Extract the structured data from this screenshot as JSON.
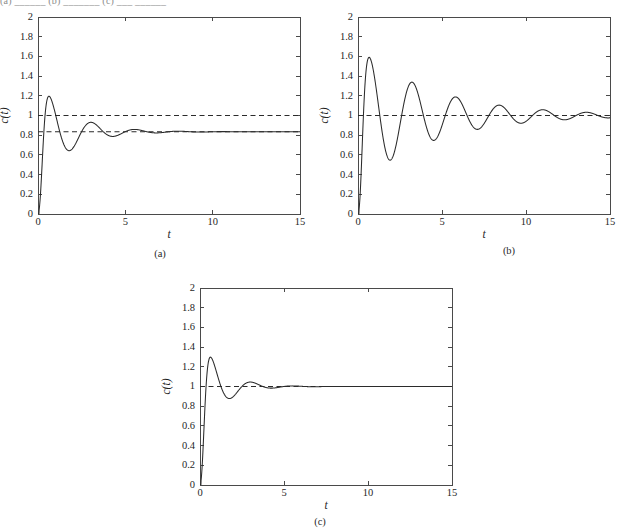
{
  "page": {
    "header_fragment": "(a)    ______  (b) _______ (c)  ___  ______",
    "background": "#ffffff",
    "ink": "#2b2b2b"
  },
  "captions": {
    "a": "(a)",
    "b": "(b)",
    "c": "(c)"
  },
  "chart_data": [
    {
      "id": "a",
      "type": "line",
      "title": "",
      "xlabel": "t",
      "ylabel": "c(t)",
      "xlim": [
        0,
        15
      ],
      "ylim": [
        0,
        2
      ],
      "xticks": [
        0,
        5,
        10,
        15
      ],
      "xticklabels": [
        "0",
        "5",
        "10",
        "15"
      ],
      "yticks": [
        0,
        0.2,
        0.4,
        0.6,
        0.8,
        1,
        1.2,
        1.4,
        1.6,
        1.8,
        2
      ],
      "yticklabels": [
        "0",
        "0.2",
        "0.4",
        "0.6",
        "0.8",
        "1",
        "1.2",
        "1.4",
        "1.6",
        "1.8",
        "2"
      ],
      "grid": false,
      "legend": null,
      "reference_lines": [
        {
          "name": "unity-reference",
          "y": 1.0,
          "style": "dashed"
        },
        {
          "name": "steady-state-reference",
          "y": 0.835,
          "style": "dashed"
        }
      ],
      "series": [
        {
          "name": "step-response-a",
          "style": "solid",
          "model": "damped-step",
          "steady_state": 0.835,
          "amplitude": 0.535,
          "damping_rate": 0.56,
          "angular_freq": 2.52,
          "phase": 1.5708,
          "rise_shape": 1.0,
          "peaks": [
            {
              "t": 1.45,
              "c": 1.285
            },
            {
              "t": 3.9,
              "c": 1.0
            },
            {
              "t": 6.35,
              "c": 0.885
            },
            {
              "t": 8.8,
              "c": 0.85
            }
          ],
          "troughs": [
            {
              "t": 2.65,
              "c": 0.545
            },
            {
              "t": 5.1,
              "c": 0.715
            },
            {
              "t": 7.55,
              "c": 0.795
            }
          ]
        }
      ]
    },
    {
      "id": "b",
      "type": "line",
      "title": "",
      "xlabel": "t",
      "ylabel": "c(t)",
      "xlim": [
        0,
        15
      ],
      "ylim": [
        0,
        2
      ],
      "xticks": [
        0,
        5,
        10,
        15
      ],
      "xticklabels": [
        "0",
        "5",
        "10",
        "15"
      ],
      "yticks": [
        0,
        0.2,
        0.4,
        0.6,
        0.8,
        1,
        1.2,
        1.4,
        1.6,
        1.8,
        2
      ],
      "yticklabels": [
        "0",
        "0.2",
        "0.4",
        "0.6",
        "0.8",
        "1",
        "1.2",
        "1.4",
        "1.6",
        "1.8",
        "2"
      ],
      "grid": false,
      "legend": null,
      "reference_lines": [
        {
          "name": "unity-reference",
          "y": 1.0,
          "style": "dashed"
        }
      ],
      "series": [
        {
          "name": "step-response-b",
          "style": "solid",
          "model": "damped-step",
          "steady_state": 1.0,
          "amplitude": 0.7,
          "damping_rate": 0.225,
          "angular_freq": 2.42,
          "phase": 1.5708,
          "rise_shape": 1.0,
          "peaks": [
            {
              "t": 1.6,
              "c": 1.63
            },
            {
              "t": 4.2,
              "c": 1.375
            },
            {
              "t": 6.85,
              "c": 1.21
            },
            {
              "t": 9.45,
              "c": 1.125
            },
            {
              "t": 12.1,
              "c": 1.08
            },
            {
              "t": 14.7,
              "c": 1.04
            }
          ],
          "troughs": [
            {
              "t": 2.9,
              "c": 0.49
            },
            {
              "t": 5.5,
              "c": 0.7
            },
            {
              "t": 8.15,
              "c": 0.815
            },
            {
              "t": 10.75,
              "c": 0.885
            },
            {
              "t": 13.4,
              "c": 0.935
            }
          ]
        }
      ]
    },
    {
      "id": "c",
      "type": "line",
      "title": "",
      "xlabel": "t",
      "ylabel": "c(t)",
      "xlim": [
        0,
        15
      ],
      "ylim": [
        0,
        2
      ],
      "xticks": [
        0,
        5,
        10,
        15
      ],
      "xticklabels": [
        "0",
        "5",
        "10",
        "15"
      ],
      "yticks": [
        0,
        0.2,
        0.4,
        0.6,
        0.8,
        1,
        1.2,
        1.4,
        1.6,
        1.8,
        2
      ],
      "yticklabels": [
        "0",
        "0.2",
        "0.4",
        "0.6",
        "0.8",
        "1",
        "1.2",
        "1.4",
        "1.6",
        "1.8",
        "2"
      ],
      "grid": false,
      "legend": null,
      "reference_lines": [
        {
          "name": "unity-reference",
          "y": 1.0,
          "style": "dashed"
        }
      ],
      "series": [
        {
          "name": "step-response-c",
          "style": "solid",
          "model": "damped-step",
          "steady_state": 1.0,
          "amplitude": 0.52,
          "damping_rate": 0.8,
          "angular_freq": 2.52,
          "phase": 1.5708,
          "rise_shape": 1.0,
          "peaks": [
            {
              "t": 1.15,
              "c": 1.44
            },
            {
              "t": 3.6,
              "c": 1.06
            },
            {
              "t": 6.0,
              "c": 1.01
            }
          ],
          "troughs": [
            {
              "t": 2.35,
              "c": 0.815
            },
            {
              "t": 4.8,
              "c": 0.965
            }
          ]
        }
      ]
    }
  ],
  "layout": {
    "panels": [
      {
        "id": "a",
        "left": 0,
        "top": 10,
        "width": 308,
        "height": 236,
        "plot_left": 38,
        "plot_top": 7,
        "plot_width": 262,
        "plot_height": 197
      },
      {
        "id": "b",
        "left": 320,
        "top": 10,
        "width": 298,
        "height": 236,
        "plot_left": 38,
        "plot_top": 7,
        "plot_width": 252,
        "plot_height": 197
      },
      {
        "id": "c",
        "left": 160,
        "top": 281,
        "width": 300,
        "height": 236,
        "plot_left": 40,
        "plot_top": 7,
        "plot_width": 252,
        "plot_height": 197
      }
    ],
    "captions": [
      {
        "id": "a",
        "left": 140,
        "top": 248
      },
      {
        "id": "b",
        "left": 489,
        "top": 245
      },
      {
        "id": "c",
        "left": 300,
        "top": 516
      }
    ]
  }
}
